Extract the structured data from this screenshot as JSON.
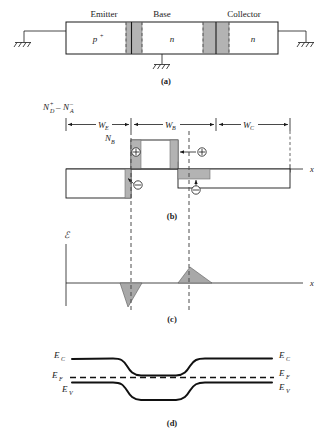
{
  "figure": {
    "panels": [
      {
        "id": "a",
        "tag": "(a)",
        "caption": "(a)"
      },
      {
        "id": "b",
        "tag": "(b)",
        "caption": "(b)"
      },
      {
        "id": "c",
        "tag": "(c)",
        "caption": "(c)"
      },
      {
        "id": "d",
        "tag": "(d)",
        "caption": "(d)"
      }
    ]
  },
  "panel_a": {
    "region_labels": [
      "Emitter",
      "Base",
      "Collector"
    ],
    "doping_labels": [
      "p",
      "n",
      "n"
    ],
    "emitter_superscript": "+",
    "terminals": [
      {
        "name": "emitter-terminal",
        "symbol": "ground"
      },
      {
        "name": "base-terminal",
        "symbol": "ground"
      },
      {
        "name": "collector-terminal",
        "symbol": "ground"
      }
    ]
  },
  "panel_b": {
    "yaxis_label_main": "N",
    "yaxis_label_parts": {
      "nd": "N",
      "nd_sub": "D",
      "nd_sup": "+",
      "minus": "–",
      "na": "N",
      "na_sub": "A",
      "na_sup": "–"
    },
    "yaxis_label_text": "N_D^+ – N_A^–",
    "width_labels": [
      {
        "base": "W",
        "sub": "E",
        "text": "W_E"
      },
      {
        "base": "W",
        "sub": "B",
        "text": "W_B"
      },
      {
        "base": "W",
        "sub": "C",
        "text": "W_C"
      }
    ],
    "nb_label": {
      "base": "N",
      "sub": "B",
      "text": "N_B"
    },
    "axis_label": "x",
    "charge_markers": [
      {
        "sign": "⊕",
        "name": "positive-charge-be"
      },
      {
        "sign": "⊖",
        "name": "negative-charge-be"
      },
      {
        "sign": "⊕",
        "name": "positive-charge-bc"
      },
      {
        "sign": "⊖",
        "name": "negative-charge-bc"
      }
    ]
  },
  "panel_c": {
    "yaxis_label": "ℰ",
    "axis_label": "x"
  },
  "panel_d": {
    "left_labels": [
      {
        "base": "E",
        "sub": "C",
        "text": "E_C"
      },
      {
        "base": "E",
        "sub": "F",
        "text": "E_F"
      },
      {
        "base": "E",
        "sub": "V",
        "text": "E_V"
      }
    ],
    "right_labels": [
      {
        "base": "E",
        "sub": "C",
        "text": "E_C"
      },
      {
        "base": "E",
        "sub": "F",
        "text": "E_F"
      },
      {
        "base": "E",
        "sub": "V",
        "text": "E_V"
      }
    ]
  },
  "colors": {
    "ink": "#1a1a1a",
    "depletion_fill": "#b3b3b3",
    "dashed_guide": "#4d4d4d",
    "background": "#ffffff"
  }
}
